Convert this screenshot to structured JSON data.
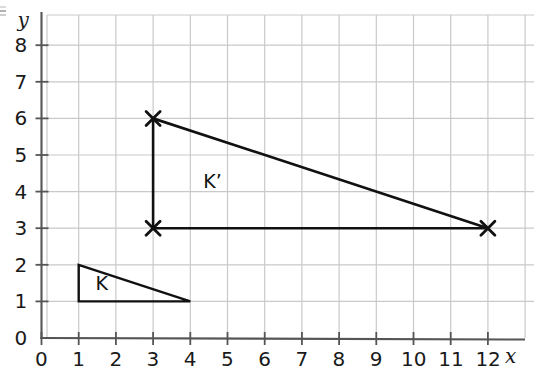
{
  "chart_data": {
    "type": "scatter",
    "title": "",
    "xlabel": "x",
    "ylabel": "y",
    "xlim": [
      0,
      13
    ],
    "ylim": [
      0,
      8.6
    ],
    "grid": true,
    "legend": "none",
    "x_ticks": [
      "0",
      "1",
      "2",
      "3",
      "4",
      "5",
      "6",
      "7",
      "8",
      "9",
      "10",
      "11",
      "12"
    ],
    "y_ticks": [
      "0",
      "1",
      "2",
      "3",
      "4",
      "5",
      "6",
      "7",
      "8"
    ],
    "x_tick_values": [
      0,
      1,
      2,
      3,
      4,
      5,
      6,
      7,
      8,
      9,
      10,
      11,
      12
    ],
    "y_tick_values": [
      0,
      1,
      2,
      3,
      4,
      5,
      6,
      7,
      8
    ],
    "shapes": [
      {
        "name": "K",
        "label": "K",
        "label_position": [
          1.45,
          1.48
        ],
        "vertices": [
          [
            1,
            2
          ],
          [
            1,
            1
          ],
          [
            4,
            1
          ]
        ],
        "closed": true,
        "markers": "none",
        "stroke": "#111111",
        "stroke_width": 2.4
      },
      {
        "name": "K'",
        "label": "K’",
        "label_position": [
          4.35,
          4.27
        ],
        "vertices": [
          [
            3,
            6
          ],
          [
            3,
            3
          ],
          [
            12,
            3
          ]
        ],
        "closed": true,
        "markers": "x",
        "stroke": "#111111",
        "stroke_width": 2.6
      }
    ],
    "marked_points": [
      {
        "x": 3,
        "y": 6,
        "marker": "x"
      },
      {
        "x": 3,
        "y": 3,
        "marker": "x"
      },
      {
        "x": 12,
        "y": 3,
        "marker": "x"
      }
    ],
    "colors": {
      "grid": "#c9c9c9",
      "axis": "#555555",
      "shape_stroke": "#111111",
      "text": "#1a1a1a",
      "background": "#ffffff"
    }
  },
  "axes": {
    "x_axis_label": "x",
    "y_axis_label": "y",
    "origin_label": "0"
  },
  "labels": {
    "shape_k": "K",
    "shape_k_prime": "K’"
  }
}
